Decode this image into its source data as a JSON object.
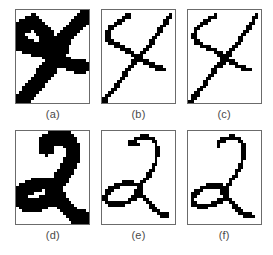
{
  "figure": {
    "background_color": "#ffffff",
    "ink_color": "#000000",
    "border_color": "#6b6b6b",
    "caption_color": "#4a4a4a",
    "rows": 2,
    "columns": 3,
    "panel_pixel_grid": {
      "cols": 25,
      "rows": 32
    }
  },
  "panels": [
    {
      "id": "panel-a",
      "caption": "(a)",
      "row": 1,
      "column": 1,
      "kind": "original-binary-character",
      "character": "4",
      "stroke_style": "thick",
      "shapes": [
        {
          "name": "upper-left-diagonal-thick",
          "type": "polyline",
          "width": 5.2,
          "points": [
            [
              1.0,
              6.6
            ],
            [
              3.4,
              5.2
            ],
            [
              6.0,
              4.0
            ],
            [
              8.4,
              6.2
            ],
            [
              10.6,
              9.0
            ],
            [
              12.6,
              12.2
            ],
            [
              14.0,
              15.2
            ]
          ]
        },
        {
          "name": "upper-right-diagonal-thick",
          "type": "polyline",
          "width": 5.0,
          "points": [
            [
              23.6,
              2.2
            ],
            [
              21.0,
              4.6
            ],
            [
              18.4,
              7.4
            ],
            [
              16.2,
              10.4
            ],
            [
              14.4,
              13.6
            ],
            [
              13.0,
              16.0
            ]
          ]
        },
        {
          "name": "left-vertical-lower-thick",
          "type": "polyline",
          "width": 5.0,
          "points": [
            [
              0.6,
              7.8
            ],
            [
              0.6,
              10.0
            ],
            [
              2.0,
              11.6
            ],
            [
              5.0,
              12.8
            ],
            [
              8.6,
              13.6
            ],
            [
              11.4,
              14.6
            ]
          ]
        },
        {
          "name": "main-long-diagonal-thick",
          "type": "polyline",
          "width": 5.4,
          "points": [
            [
              2.2,
              30.8
            ],
            [
              4.6,
              28.2
            ],
            [
              7.2,
              25.2
            ],
            [
              9.6,
              22.2
            ],
            [
              11.8,
              19.2
            ],
            [
              13.6,
              16.4
            ],
            [
              15.0,
              14.0
            ]
          ]
        },
        {
          "name": "lower-right-branch-thick",
          "type": "polyline",
          "width": 4.6,
          "points": [
            [
              13.6,
              16.4
            ],
            [
              16.0,
              17.6
            ],
            [
              18.4,
              18.6
            ],
            [
              20.6,
              19.4
            ],
            [
              22.6,
              19.6
            ]
          ]
        }
      ]
    },
    {
      "id": "panel-b",
      "caption": "(b)",
      "row": 1,
      "column": 2,
      "kind": "thinned-skeleton",
      "character": "4",
      "stroke_style": "thin",
      "shapes": [
        {
          "name": "upper-left-branch-thin",
          "type": "polyline",
          "width": 1.5,
          "points": [
            [
              2.0,
              8.6
            ],
            [
              2.2,
              7.0
            ],
            [
              3.4,
              5.6
            ],
            [
              5.2,
              4.4
            ],
            [
              7.2,
              3.2
            ],
            [
              9.0,
              2.0
            ]
          ]
        },
        {
          "name": "left-hook-thin",
          "type": "polyline",
          "width": 1.5,
          "points": [
            [
              2.0,
              8.6
            ],
            [
              2.2,
              10.4
            ],
            [
              3.8,
              11.6
            ],
            [
              6.0,
              12.6
            ],
            [
              8.4,
              13.6
            ],
            [
              10.6,
              14.8
            ],
            [
              12.0,
              16.2
            ]
          ]
        },
        {
          "name": "upper-right-branch-thin",
          "type": "polyline",
          "width": 1.5,
          "points": [
            [
              23.4,
              1.6
            ],
            [
              22.4,
              3.6
            ],
            [
              21.0,
              5.6
            ],
            [
              19.4,
              7.8
            ],
            [
              17.6,
              10.2
            ],
            [
              15.8,
              12.6
            ],
            [
              13.8,
              15.0
            ],
            [
              12.6,
              16.4
            ]
          ]
        },
        {
          "name": "main-diagonal-thin",
          "type": "polyline",
          "width": 1.5,
          "points": [
            [
              1.4,
              30.4
            ],
            [
              3.4,
              28.0
            ],
            [
              5.4,
              25.4
            ],
            [
              7.4,
              22.8
            ],
            [
              9.2,
              20.4
            ],
            [
              10.8,
              18.2
            ],
            [
              12.2,
              16.4
            ]
          ]
        },
        {
          "name": "lower-right-branch-thin",
          "type": "polyline",
          "width": 1.5,
          "points": [
            [
              12.4,
              16.6
            ],
            [
              14.6,
              17.8
            ],
            [
              16.8,
              19.0
            ],
            [
              19.0,
              20.0
            ],
            [
              21.0,
              20.2
            ]
          ]
        },
        {
          "name": "bottom-left-artifact-dot",
          "type": "dot",
          "size": 1.8,
          "point": [
            1.0,
            31.0
          ]
        }
      ]
    },
    {
      "id": "panel-c",
      "caption": "(c)",
      "row": 1,
      "column": 3,
      "kind": "thinned-skeleton-alternate",
      "character": "4",
      "stroke_style": "thin",
      "shapes": [
        {
          "name": "upper-left-branch-thin",
          "type": "polyline",
          "width": 1.5,
          "points": [
            [
              2.2,
              9.0
            ],
            [
              2.4,
              7.2
            ],
            [
              3.6,
              5.6
            ],
            [
              5.4,
              4.4
            ],
            [
              7.4,
              3.2
            ],
            [
              9.2,
              2.0
            ]
          ]
        },
        {
          "name": "left-hook-thin",
          "type": "polyline",
          "width": 1.5,
          "points": [
            [
              2.2,
              9.0
            ],
            [
              2.6,
              10.8
            ],
            [
              4.2,
              12.0
            ],
            [
              6.4,
              12.8
            ],
            [
              8.8,
              13.6
            ],
            [
              10.6,
              14.6
            ],
            [
              11.6,
              15.8
            ]
          ]
        },
        {
          "name": "upper-right-branch-thin",
          "type": "polyline",
          "width": 1.5,
          "points": [
            [
              23.6,
              1.4
            ],
            [
              22.6,
              3.4
            ],
            [
              21.2,
              5.6
            ],
            [
              19.6,
              7.8
            ],
            [
              17.8,
              10.2
            ],
            [
              16.0,
              12.6
            ],
            [
              14.0,
              15.0
            ],
            [
              12.6,
              16.4
            ]
          ]
        },
        {
          "name": "short-vertical-connector",
          "type": "polyline",
          "width": 1.5,
          "points": [
            [
              11.6,
              15.8
            ],
            [
              11.8,
              17.4
            ],
            [
              12.0,
              18.8
            ]
          ]
        },
        {
          "name": "main-diagonal-thin",
          "type": "polyline",
          "width": 1.5,
          "points": [
            [
              1.6,
              30.6
            ],
            [
              3.6,
              28.2
            ],
            [
              5.6,
              25.6
            ],
            [
              7.6,
              23.0
            ],
            [
              9.4,
              20.6
            ],
            [
              10.8,
              18.8
            ],
            [
              12.0,
              18.8
            ]
          ]
        },
        {
          "name": "lower-right-branch-thin",
          "type": "polyline",
          "width": 1.5,
          "points": [
            [
              12.6,
              16.8
            ],
            [
              14.8,
              18.0
            ],
            [
              17.0,
              19.2
            ],
            [
              19.2,
              20.2
            ],
            [
              21.2,
              20.4
            ]
          ]
        },
        {
          "name": "bottom-left-artifact-dot",
          "type": "dot",
          "size": 1.8,
          "point": [
            1.2,
            31.2
          ]
        }
      ]
    },
    {
      "id": "panel-d",
      "caption": "(d)",
      "row": 2,
      "column": 1,
      "kind": "original-binary-character",
      "character": "2",
      "stroke_style": "thick",
      "shapes": [
        {
          "name": "top-arc-thick",
          "type": "polyline",
          "width": 5.2,
          "points": [
            [
              10.4,
              6.0
            ],
            [
              10.6,
              3.8
            ],
            [
              12.6,
              2.4
            ],
            [
              15.2,
              2.0
            ],
            [
              17.6,
              2.8
            ],
            [
              19.0,
              4.8
            ],
            [
              19.4,
              7.2
            ]
          ]
        },
        {
          "name": "right-descender-thick",
          "type": "polyline",
          "width": 5.2,
          "points": [
            [
              19.4,
              7.2
            ],
            [
              19.0,
              10.0
            ],
            [
              17.8,
              12.6
            ],
            [
              16.2,
              15.0
            ],
            [
              14.6,
              17.2
            ],
            [
              13.2,
              19.2
            ]
          ]
        },
        {
          "name": "loop-ellipse-thick",
          "type": "ellipse",
          "width": 4.8,
          "cx": 7.4,
          "cy": 21.8,
          "rx": 6.2,
          "ry": 3.4,
          "rotate": -18
        },
        {
          "name": "lower-right-tail-thick",
          "type": "polyline",
          "width": 5.2,
          "points": [
            [
              12.2,
              20.6
            ],
            [
              14.4,
              23.0
            ],
            [
              16.6,
              25.6
            ],
            [
              18.6,
              27.8
            ],
            [
              20.6,
              29.2
            ],
            [
              22.8,
              29.6
            ]
          ]
        }
      ]
    },
    {
      "id": "panel-e",
      "caption": "(e)",
      "row": 2,
      "column": 2,
      "kind": "thinned-skeleton",
      "character": "2",
      "stroke_style": "thin",
      "shapes": [
        {
          "name": "top-arc-thin",
          "type": "polyline",
          "width": 1.5,
          "points": [
            [
              10.0,
              4.0
            ],
            [
              12.0,
              2.6
            ],
            [
              14.4,
              2.0
            ],
            [
              16.8,
              2.4
            ],
            [
              18.4,
              4.0
            ],
            [
              19.0,
              6.2
            ],
            [
              18.8,
              8.6
            ]
          ]
        },
        {
          "name": "top-arc-left-stub",
          "type": "polyline",
          "width": 1.5,
          "points": [
            [
              10.0,
              4.0
            ],
            [
              11.0,
              4.4
            ],
            [
              12.2,
              4.6
            ]
          ]
        },
        {
          "name": "right-descender-thin",
          "type": "polyline",
          "width": 1.5,
          "points": [
            [
              18.8,
              8.6
            ],
            [
              18.2,
              11.0
            ],
            [
              17.0,
              13.4
            ],
            [
              15.4,
              15.8
            ],
            [
              13.8,
              18.0
            ],
            [
              12.4,
              19.8
            ]
          ]
        },
        {
          "name": "loop-ellipse-thin",
          "type": "ellipse",
          "width": 1.5,
          "cx": 7.0,
          "cy": 21.6,
          "rx": 6.0,
          "ry": 3.2,
          "rotate": -18
        },
        {
          "name": "lower-right-tail-thin",
          "type": "polyline",
          "width": 1.5,
          "points": [
            [
              12.2,
              20.2
            ],
            [
              14.2,
              22.6
            ],
            [
              16.2,
              25.0
            ],
            [
              18.2,
              27.2
            ],
            [
              20.2,
              28.8
            ],
            [
              22.4,
              29.0
            ]
          ]
        }
      ]
    },
    {
      "id": "panel-f",
      "caption": "(f)",
      "row": 2,
      "column": 3,
      "kind": "thinned-skeleton-alternate",
      "character": "2",
      "stroke_style": "thin",
      "shapes": [
        {
          "name": "top-arc-thin",
          "type": "polyline",
          "width": 1.5,
          "points": [
            [
              10.4,
              4.0
            ],
            [
              12.4,
              2.6
            ],
            [
              14.8,
              2.0
            ],
            [
              17.0,
              2.4
            ],
            [
              18.6,
              4.0
            ],
            [
              19.2,
              6.2
            ],
            [
              19.0,
              8.6
            ]
          ]
        },
        {
          "name": "top-arc-left-stub",
          "type": "polyline",
          "width": 1.5,
          "points": [
            [
              10.4,
              4.0
            ],
            [
              10.4,
              5.0
            ],
            [
              10.6,
              5.6
            ]
          ]
        },
        {
          "name": "right-descender-thin",
          "type": "polyline",
          "width": 1.5,
          "points": [
            [
              19.0,
              8.6
            ],
            [
              18.4,
              11.0
            ],
            [
              17.2,
              13.4
            ],
            [
              15.6,
              15.8
            ],
            [
              14.0,
              18.2
            ],
            [
              12.4,
              20.4
            ]
          ]
        },
        {
          "name": "loop-ellipse-thin",
          "type": "ellipse",
          "width": 1.5,
          "cx": 7.2,
          "cy": 22.4,
          "rx": 6.0,
          "ry": 3.2,
          "rotate": -18
        },
        {
          "name": "lower-right-tail-thin",
          "type": "polyline",
          "width": 1.5,
          "points": [
            [
              11.8,
              21.0
            ],
            [
              13.8,
              23.4
            ],
            [
              15.8,
              25.8
            ],
            [
              17.8,
              27.8
            ],
            [
              19.8,
              29.0
            ],
            [
              22.0,
              29.2
            ]
          ]
        }
      ]
    }
  ]
}
